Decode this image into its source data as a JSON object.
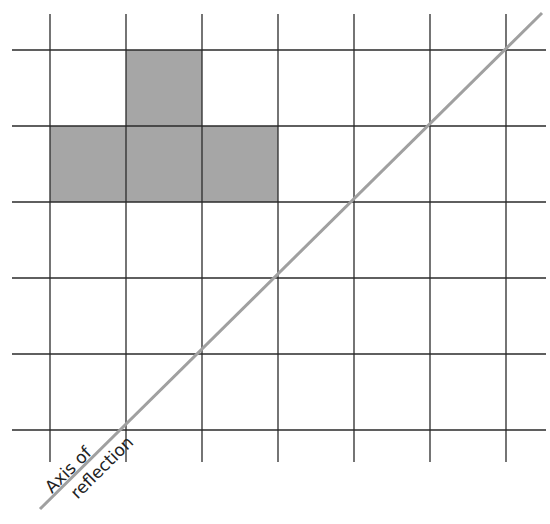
{
  "diagram": {
    "grid": {
      "x_lines": [
        50,
        126,
        202,
        278,
        354,
        430,
        506
      ],
      "y_lines": [
        50,
        126,
        202,
        278,
        354,
        430
      ],
      "x_extent": [
        12,
        546
      ],
      "y_extent": [
        14,
        462
      ],
      "line_color": "#2a2a2a"
    },
    "shape": {
      "fill": "#a6a6a6",
      "cells": [
        {
          "col": 1,
          "row": 0
        },
        {
          "col": 0,
          "row": 1
        },
        {
          "col": 1,
          "row": 1
        },
        {
          "col": 2,
          "row": 1
        }
      ]
    },
    "axis": {
      "from": [
        40,
        509
      ],
      "to": [
        542,
        13
      ],
      "color": "#a0a0a0",
      "label_line1": "Axis of",
      "label_line2": "reflection"
    }
  }
}
